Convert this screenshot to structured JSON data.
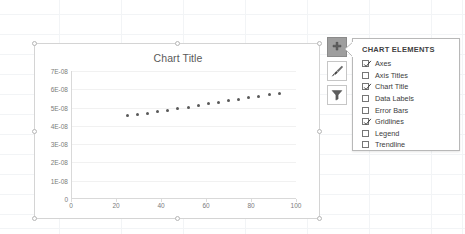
{
  "chart": {
    "title": "Chart Title",
    "selected": true
  },
  "chart_data": {
    "type": "scatter",
    "title": "Chart Title",
    "xlabel": "",
    "ylabel": "",
    "xlim": [
      0,
      100
    ],
    "ylim": [
      0,
      7e-08
    ],
    "grid": true,
    "legend": false,
    "xticks": [
      "0",
      "20",
      "40",
      "60",
      "80",
      "100"
    ],
    "xtick_values": [
      0,
      20,
      40,
      60,
      80,
      100
    ],
    "yticks": [
      "0",
      "1E-08",
      "2E-08",
      "3E-08",
      "4E-08",
      "5E-08",
      "6E-08",
      "7E-08"
    ],
    "ytick_values": [
      0,
      1e-08,
      2e-08,
      3e-08,
      4e-08,
      5e-08,
      6e-08,
      7e-08
    ],
    "series": [
      {
        "name": "Series1",
        "x": [
          25,
          29.5,
          34,
          38.5,
          43,
          47.5,
          52,
          56.5,
          61,
          65.5,
          70,
          74.5,
          79,
          83.5,
          88,
          92.5
        ],
        "y": [
          4.55e-08,
          4.62e-08,
          4.7e-08,
          4.78e-08,
          4.86e-08,
          4.95e-08,
          5.02e-08,
          5.1e-08,
          5.2e-08,
          5.28e-08,
          5.36e-08,
          5.45e-08,
          5.55e-08,
          5.63e-08,
          5.7e-08,
          5.76e-08
        ]
      }
    ]
  },
  "side_buttons": [
    {
      "name": "chart-elements-button",
      "icon": "plus-icon",
      "active": true
    },
    {
      "name": "chart-styles-button",
      "icon": "paintbrush-icon",
      "active": false
    },
    {
      "name": "chart-filters-button",
      "icon": "filter-icon",
      "active": false
    }
  ],
  "chart_elements": {
    "header": "CHART ELEMENTS",
    "items": [
      {
        "label": "Axes",
        "checked": true
      },
      {
        "label": "Axis Titles",
        "checked": false
      },
      {
        "label": "Chart Title",
        "checked": true
      },
      {
        "label": "Data Labels",
        "checked": false
      },
      {
        "label": "Error Bars",
        "checked": false
      },
      {
        "label": "Gridlines",
        "checked": true
      },
      {
        "label": "Legend",
        "checked": false
      },
      {
        "label": "Trendline",
        "checked": false
      }
    ]
  },
  "colors": {
    "marker": "#595959",
    "axis": "#d9d9d9",
    "gridline": "#f1f1f1",
    "text": "#7b7b7b",
    "active_button": "#9e9e9e",
    "panel_border": "#b8b8b8"
  }
}
